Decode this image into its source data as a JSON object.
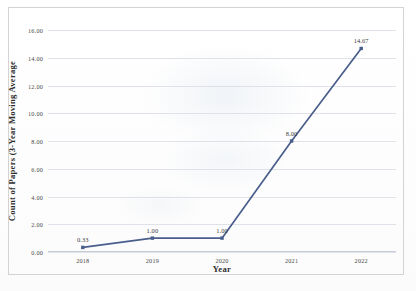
{
  "chart_data": {
    "type": "line",
    "title": "",
    "xlabel": "Year",
    "ylabel": "Count of Papers (3-Year Moving Average",
    "categories": [
      "2018",
      "2019",
      "2020",
      "2021",
      "2022"
    ],
    "values": [
      0.33,
      1.0,
      1.0,
      8.0,
      14.67
    ],
    "point_labels": [
      "0.33",
      "1.00",
      "1.00",
      "8.00",
      "14.67"
    ],
    "ylim": [
      0,
      16
    ],
    "yticks": [
      "0.00",
      "2.00",
      "4.00",
      "6.00",
      "8.00",
      "10.00",
      "12.00",
      "14.00",
      "16.00"
    ],
    "ytick_values": [
      0,
      2,
      4,
      6,
      8,
      10,
      12,
      14,
      16
    ],
    "grid": true,
    "legend": "none",
    "series_color": "#4A5E8C",
    "grid_color": "#D9DDE4",
    "marker": "square"
  }
}
